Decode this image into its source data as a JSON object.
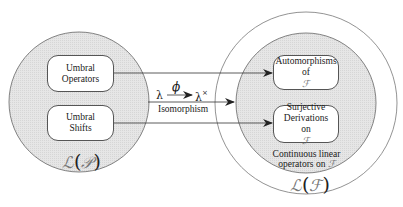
{
  "diagram": {
    "left_set": {
      "label_L": "ℒ",
      "label_arg": "𝒫",
      "open": "(",
      "close": ")",
      "boxes": [
        {
          "lines": [
            "Umbral",
            "Operators"
          ]
        },
        {
          "lines": [
            "Umbral",
            "Shifts"
          ]
        }
      ]
    },
    "right_set": {
      "label_L": "ℒ",
      "label_arg": "ℱ",
      "open": "(",
      "close": ")",
      "inner_caption": [
        "Continuous linear",
        "operators on"
      ],
      "inner_caption_symbol": "ℱ",
      "boxes": [
        {
          "lines": [
            "Automorphisms",
            "of"
          ],
          "symbol": "ℱ"
        },
        {
          "lines": [
            "Surjective",
            "Derivations",
            "on"
          ],
          "symbol": "ℱ"
        }
      ]
    },
    "mapping": {
      "from": "λ",
      "map_symbol": "ϕ",
      "to": "λ",
      "to_superscript": "×",
      "caption": "Isomorphism"
    },
    "colors": {
      "circle_fill": "#e3e3e3",
      "stroke": "#555555",
      "background": "#ffffff"
    }
  }
}
